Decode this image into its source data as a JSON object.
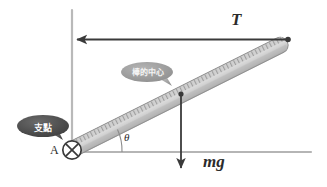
{
  "figure": {
    "title": "",
    "type": "physics-free-body-diagram"
  },
  "labels": {
    "tension": "T",
    "weight": "mg",
    "pivot_point": "A",
    "angle": "θ"
  },
  "callouts": [
    {
      "id": "fulcrum",
      "text": "支點",
      "meaning": "fulcrum",
      "color": "#4a4a4a"
    },
    {
      "id": "rod-center",
      "text": "棒的中心",
      "meaning": "center of the rod",
      "color": "#9a9a9a"
    }
  ],
  "colors": {
    "background": "#ffffff",
    "wall_line": "#b9b9b9",
    "ground_line": "#b5b5b5",
    "arrow": "#3a3a3a",
    "rod_body_light": "#dcdcdc",
    "rod_body_dark": "#a8a8a8",
    "rod_outline": "#808080",
    "bubble_dark": "#4a4a4a",
    "bubble_light": "#9a9a9a",
    "text": "#2b2b2b"
  },
  "geometry": {
    "pivot": {
      "x": 72,
      "y": 150
    },
    "rod_top_end": {
      "x": 289,
      "y": 41
    },
    "rod_midpoint": {
      "x": 181,
      "y": 94
    },
    "angle_degrees": 26,
    "tension_arrow": {
      "from_x": 287,
      "from_y": 39,
      "to_x": 73,
      "to_y": 39
    },
    "weight_arrow": {
      "from_x": 181,
      "from_y": 94,
      "to_x": 181,
      "to_y": 172
    },
    "wall": {
      "x": 72,
      "y_top": 10,
      "y_bottom": 152
    },
    "ground": {
      "y": 152,
      "x_left": 72,
      "x_right": 311
    }
  }
}
